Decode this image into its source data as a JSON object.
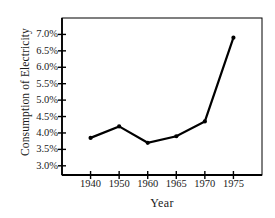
{
  "chart_data": {
    "type": "line",
    "title": "",
    "xlabel": "Year",
    "ylabel": "Consumption of Electricity",
    "categories": [
      "1940",
      "1950",
      "1960",
      "1965",
      "1970",
      "1975"
    ],
    "values": [
      3.85,
      4.2,
      3.7,
      3.9,
      4.35,
      6.9
    ],
    "value_suffix": "%",
    "ytick_labels": [
      "7.0%",
      "6.5%",
      "6.0%",
      "5.5%",
      "5.0%",
      "4.5%",
      "4.0%",
      "3.5%",
      "3.0%"
    ],
    "ytick_values": [
      7.0,
      6.5,
      6.0,
      5.5,
      5.0,
      4.5,
      4.0,
      3.5,
      3.0
    ],
    "ylim": [
      2.72,
      7.5
    ],
    "xlim_categorical": true,
    "grid": false,
    "legend": null,
    "series": [
      {
        "name": "Consumption of Electricity",
        "values": [
          3.85,
          4.2,
          3.7,
          3.9,
          4.35,
          6.9
        ]
      }
    ],
    "marker": "filled-circle",
    "line_color": "#000000",
    "marker_color": "#000000",
    "axis_color": "#000000",
    "background_color": "#ffffff"
  }
}
